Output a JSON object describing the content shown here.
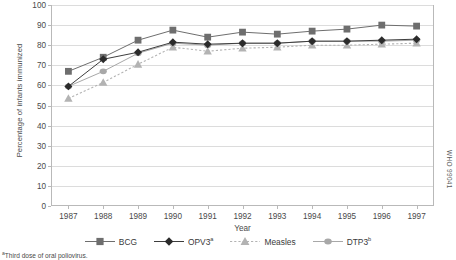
{
  "chart_data": {
    "type": "line",
    "title": "",
    "xlabel": "Year",
    "ylabel": "Percentage of infants immunized",
    "ylim": [
      0,
      100
    ],
    "ytick_step": 10,
    "grid": true,
    "legend_position": "bottom",
    "categories": [
      "1987",
      "1988",
      "1989",
      "1990",
      "1991",
      "1992",
      "1993",
      "1994",
      "1995",
      "1996",
      "1997"
    ],
    "yticks": [
      "0",
      "10",
      "20",
      "30",
      "40",
      "50",
      "60",
      "70",
      "80",
      "90",
      "100"
    ],
    "series": [
      {
        "name": "BCG",
        "legend_label": "BCG",
        "marker": "square",
        "color": "#6e6e6e",
        "line_color": "#6e6e6e",
        "line_style": "solid",
        "values": [
          67,
          74,
          82.5,
          87.5,
          84,
          86.5,
          85.5,
          87,
          88,
          90,
          89.5
        ]
      },
      {
        "name": "OPV3",
        "legend_label": "OPV3",
        "legend_superscript": "a",
        "marker": "diamond",
        "color": "#2b2b2b",
        "line_color": "#3d3d3d",
        "line_style": "solid",
        "values": [
          59.5,
          73,
          76.5,
          81.5,
          80.5,
          81,
          81,
          82,
          82,
          82.5,
          83
        ]
      },
      {
        "name": "Measles",
        "legend_label": "Measles",
        "marker": "triangle",
        "color": "#b3b3b3",
        "line_color": "#b3b3b3",
        "line_style": "dotted",
        "values": [
          53.5,
          61.5,
          70.5,
          79,
          77,
          78.5,
          79,
          80,
          80,
          80.5,
          81
        ]
      },
      {
        "name": "DTP3",
        "legend_label": "DTP3",
        "legend_superscript": "b",
        "marker": "circle",
        "color": "#a8a8a8",
        "line_color": "#a8a8a8",
        "line_style": "solid",
        "values": [
          59.5,
          67,
          76,
          81,
          80,
          81,
          81,
          82,
          82,
          82,
          82.5
        ]
      }
    ]
  },
  "watermark": "WHO 99041",
  "footnote": {
    "marker": "a",
    "text": "Third dose of oral poliovirus."
  }
}
